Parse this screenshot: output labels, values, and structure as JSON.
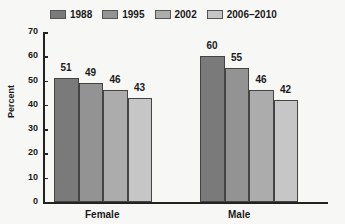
{
  "chart_data": {
    "type": "bar",
    "title": "",
    "xlabel": "",
    "ylabel": "Percent",
    "ylim": [
      0,
      70
    ],
    "yticks": [
      0,
      10,
      20,
      30,
      40,
      50,
      60,
      70
    ],
    "categories": [
      "Female",
      "Male"
    ],
    "series": [
      {
        "name": "1988",
        "values": [
          51,
          60
        ],
        "color": "#7a7a7a"
      },
      {
        "name": "1995",
        "values": [
          49,
          55
        ],
        "color": "#939393"
      },
      {
        "name": "2002",
        "values": [
          46,
          46
        ],
        "color": "#acacac"
      },
      {
        "name": "2006–2010",
        "values": [
          43,
          42
        ],
        "color": "#c6c6c6"
      }
    ],
    "legend_position": "top",
    "grid": false
  }
}
